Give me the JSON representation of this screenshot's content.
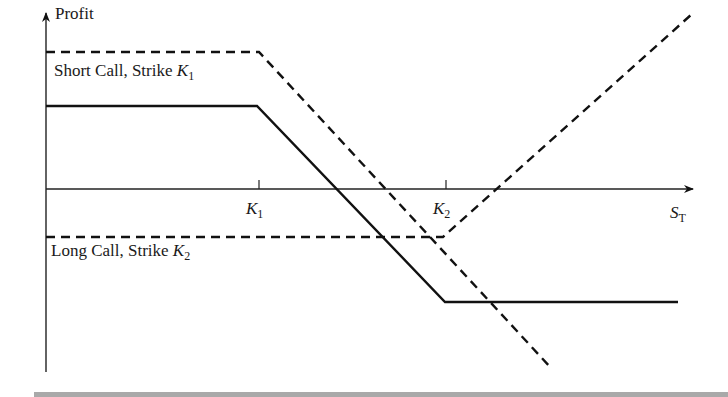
{
  "diagram": {
    "y_axis_label": "Profit",
    "x_axis_label_main": "S",
    "x_axis_label_sub": "T",
    "ticks": [
      {
        "main": "K",
        "sub": "1"
      },
      {
        "main": "K",
        "sub": "2"
      }
    ],
    "curves": [
      {
        "name": "Short Call, Strike K1",
        "label_text": "Short Call, Strike ",
        "label_var": "K",
        "label_sub": "1",
        "style": "dashed"
      },
      {
        "name": "Long Call, Strike K2",
        "label_text": "Long Call, Strike ",
        "label_var": "K",
        "label_sub": "2",
        "style": "dashed"
      },
      {
        "name": "Bear spread (combined)",
        "style": "solid"
      }
    ],
    "colors": {
      "line": "#111111",
      "footer_bar": "#a9a9a9"
    }
  }
}
